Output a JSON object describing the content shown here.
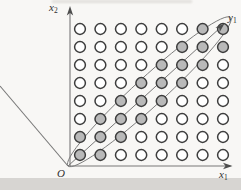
{
  "canvas": {
    "width": 241,
    "height": 190,
    "background": "#f8f7f5"
  },
  "figure": {
    "line_color": "#787878",
    "arrow_color": "#4d4d4d",
    "labels": {
      "axis_x2": {
        "base": "x",
        "sub": "2"
      },
      "axis_x1": {
        "base": "x",
        "sub": "1"
      },
      "origin": "O",
      "vector_y1": {
        "base": "y",
        "sub": "1"
      }
    },
    "geometry": {
      "lines": [
        {
          "name": "x2-axis-line",
          "x1": 70,
          "y1": 166,
          "x2": 70,
          "y2": 11,
          "w": 1.1
        },
        {
          "name": "x1-axis-line",
          "x1": 68,
          "y1": 166,
          "x2": 230.5,
          "y2": 166,
          "w": 1.1
        },
        {
          "name": "upleft-diagonal-line",
          "x1": 68,
          "y1": 166,
          "x2": 0,
          "y2": 86,
          "w": 1.1
        },
        {
          "name": "vector-y1-shaft",
          "x1": 68,
          "y1": 166,
          "x2": 220.5,
          "y2": 27.5,
          "w": 1.0
        }
      ],
      "arrowheads": [
        {
          "name": "x2-axis-arrowhead",
          "points": "70,6 66.8,15.5 70,13 73.2,15.5"
        },
        {
          "name": "x1-axis-arrowhead",
          "points": "232.5,166 223,162.8 225.5,166 223,169.2"
        },
        {
          "name": "vector-y1-arrowhead",
          "points": "224.5,23.5 219.6,32.2 219.3,28.2 215.4,27.6"
        }
      ],
      "ellipse": {
        "cx": 149.25,
        "cy": 91.75,
        "rx": 110,
        "ry": 14.5,
        "rotate": -42.4,
        "w": 0.9
      },
      "grid": {
        "cols": [
          80,
          100.4,
          120.9,
          141.3,
          161.7,
          182.1,
          202.6,
          223
        ],
        "rows": [
          29,
          47,
          65,
          83,
          101,
          119,
          137,
          155
        ],
        "radius": 5.4,
        "stroke": "#3d3d3d",
        "stroke_width": 1.5,
        "fill": "#ffffff",
        "shaded_fill": "#b9b9b9",
        "shaded_cells": [
          [
            0,
            6
          ],
          [
            0,
            7
          ],
          [
            1,
            5
          ],
          [
            1,
            6
          ],
          [
            1,
            7
          ],
          [
            2,
            4
          ],
          [
            2,
            5
          ],
          [
            2,
            6
          ],
          [
            3,
            3
          ],
          [
            3,
            4
          ],
          [
            3,
            5
          ],
          [
            4,
            2
          ],
          [
            4,
            3
          ],
          [
            4,
            4
          ],
          [
            5,
            1
          ],
          [
            5,
            2
          ],
          [
            5,
            3
          ],
          [
            6,
            0
          ],
          [
            6,
            1
          ],
          [
            6,
            2
          ],
          [
            7,
            0
          ],
          [
            7,
            1
          ]
        ]
      }
    }
  }
}
